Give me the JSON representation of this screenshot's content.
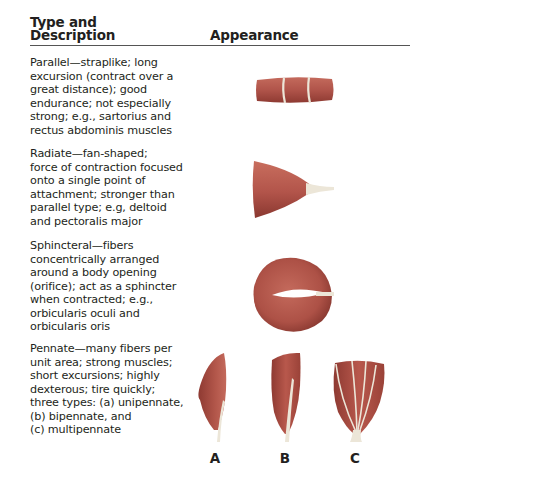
{
  "header": {
    "type_line1": "Type and",
    "type_line2": "Description",
    "appearance": "Appearance"
  },
  "colors": {
    "muscle": "#b8564a",
    "muscle_dark": "#8e3a32",
    "tendon": "#ece6d8",
    "text": "#231f20"
  },
  "rows": [
    {
      "type": "Parallel",
      "lines": [
        "Parallel—straplike; long",
        "excursion (contract over a",
        "great distance); good",
        "endurance; not especially",
        "strong; e.g., sartorius and",
        "rectus abdominis muscles"
      ],
      "illustration": "parallel-muscle"
    },
    {
      "type": "Radiate",
      "lines": [
        "Radiate—fan-shaped;",
        "force of contraction focused",
        "onto a single point of",
        "attachment; stronger than",
        "parallel type; e.g, deltoid",
        "and pectoralis major"
      ],
      "illustration": "radiate-muscle"
    },
    {
      "type": "Sphincteral",
      "lines": [
        "Sphincteral—fibers",
        "concentrically arranged",
        "around a body opening",
        "(orifice); act as a sphincter",
        "when contracted; e.g.,",
        "orbicularis oculi and",
        "orbicularis oris"
      ],
      "illustration": "sphincter-muscle"
    },
    {
      "type": "Pennate",
      "lines": [
        "Pennate—many fibers per",
        "unit area; strong muscles;",
        "short excursions; highly",
        "dexterous; tire quickly;",
        "three types: (a) unipennate,",
        "(b) bipennate, and",
        "(c) multipennate"
      ],
      "illustration": "pennate-muscles"
    }
  ],
  "pennate_labels": [
    "A",
    "B",
    "C"
  ]
}
